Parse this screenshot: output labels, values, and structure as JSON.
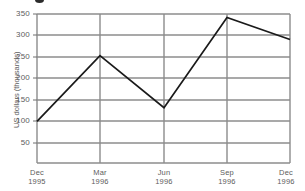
{
  "figure": {
    "artifact_name": "clipped-glyph"
  },
  "chart_data": {
    "type": "line",
    "title": "",
    "xlabel": "",
    "ylabel": "US dollars (thousands)",
    "categories": [
      "Dec 1995",
      "Mar 1996",
      "Jun 1996",
      "Sep 1996",
      "Dec 1996"
    ],
    "x_tick_labels": [
      {
        "month": "Dec",
        "year": "1995"
      },
      {
        "month": "Mar",
        "year": "1996"
      },
      {
        "month": "Jun",
        "year": "1996"
      },
      {
        "month": "Sep",
        "year": "1996"
      },
      {
        "month": "Dec",
        "year": "1996"
      }
    ],
    "values": [
      98,
      252,
      130,
      342,
      290
    ],
    "y_tick_labels": [
      "350",
      "300",
      "250",
      "200",
      "150",
      "100",
      "50"
    ],
    "y_ticks": [
      350,
      300,
      250,
      200,
      150,
      100,
      50
    ],
    "ylim": [
      0,
      350
    ],
    "grid": "both",
    "legend": "none",
    "line_color": "#1a1a1a",
    "grid_color": "#8c8c8c",
    "axis_color": "#6e6e6e",
    "background": "#ffffff"
  }
}
